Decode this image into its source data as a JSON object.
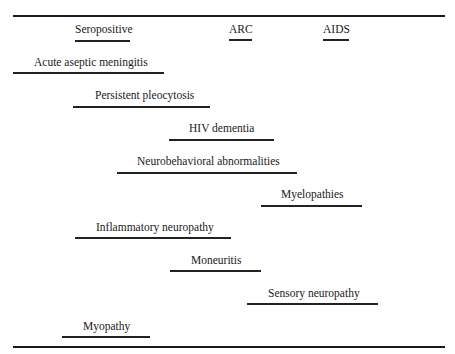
{
  "stages": [
    {
      "label": "Seropositive",
      "text_x": 75,
      "line_x1": 75,
      "line_x2": 130
    },
    {
      "label": "ARC",
      "text_x": 229,
      "line_x1": 229,
      "line_x2": 252
    },
    {
      "label": "AIDS",
      "text_x": 323,
      "line_x1": 323,
      "line_x2": 349
    }
  ],
  "disorders": [
    {
      "label": "Acute aseptic meningitis",
      "text_x": 34,
      "text_y": 56,
      "line_y": 72,
      "line_x1": 13,
      "line_x2": 164
    },
    {
      "label": "Persistent pleocytosis",
      "text_x": 95,
      "text_y": 89,
      "line_y": 106,
      "line_x1": 73,
      "line_x2": 210
    },
    {
      "label": "HIV dementia",
      "text_x": 189,
      "text_y": 122,
      "line_y": 139,
      "line_x1": 169,
      "line_x2": 274
    },
    {
      "label": "Neurobehavioral abnormalities",
      "text_x": 137,
      "text_y": 155,
      "line_y": 172,
      "line_x1": 117,
      "line_x2": 297
    },
    {
      "label": "Myelopathies",
      "text_x": 281,
      "text_y": 188,
      "line_y": 205,
      "line_x1": 261,
      "line_x2": 362
    },
    {
      "label": "Inflammatory neuropathy",
      "text_x": 96,
      "text_y": 221,
      "line_y": 237,
      "line_x1": 75,
      "line_x2": 231
    },
    {
      "label": "Moneuritis",
      "text_x": 191,
      "text_y": 254,
      "line_y": 270,
      "line_x1": 170,
      "line_x2": 261
    },
    {
      "label": "Sensory neuropathy",
      "text_x": 268,
      "text_y": 287,
      "line_y": 303,
      "line_x1": 247,
      "line_x2": 378
    },
    {
      "label": "Myopathy",
      "text_x": 83,
      "text_y": 320,
      "line_y": 336,
      "line_x1": 62,
      "line_x2": 150
    }
  ]
}
